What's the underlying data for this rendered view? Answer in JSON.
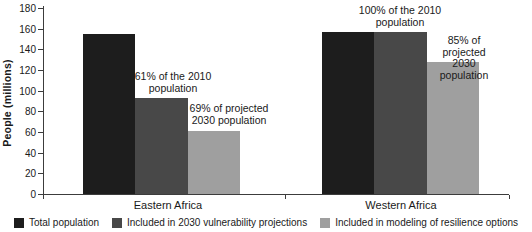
{
  "chart_data": {
    "type": "bar",
    "title": "",
    "xlabel": "",
    "ylabel": "People (millions)",
    "ylim": [
      0,
      180
    ],
    "ytick_step": 20,
    "grid": false,
    "legend_position": "bottom",
    "categories": [
      "Eastern Africa",
      "Western Africa"
    ],
    "series": [
      {
        "name": "Total population",
        "color": "#1d1d1d",
        "values": [
          155,
          157
        ]
      },
      {
        "name": "Included in 2030 vulnerability projections",
        "color": "#484848",
        "values": [
          93,
          157
        ]
      },
      {
        "name": "Included in modeling of resilience options",
        "color": "#9f9f9f",
        "values": [
          61,
          128
        ]
      }
    ],
    "annotations": [
      {
        "text": "61% of the 2010\npopulation",
        "cx": 173,
        "top": 71
      },
      {
        "text": "69% of projected\n2030 population",
        "cx": 229,
        "top": 103
      },
      {
        "text": "100% of the 2010\npopulation",
        "cx": 400,
        "top": 5
      },
      {
        "text": "85% of projected\n2030 population",
        "cx": 464,
        "top": 35
      }
    ]
  },
  "colors": {
    "text": "#1a1a1a",
    "axis": "#3c3c3c",
    "background": "#ffffff"
  }
}
